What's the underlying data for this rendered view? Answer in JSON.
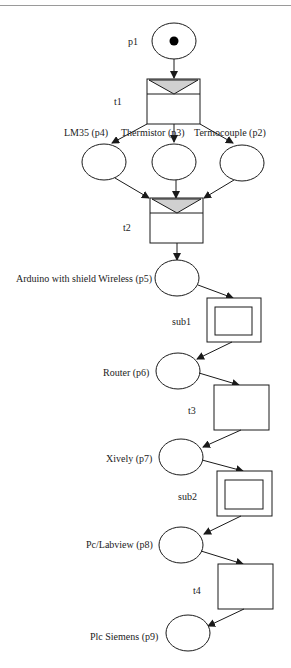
{
  "diagram": {
    "type": "petri-net",
    "colors": {
      "stroke": "#1a1a1a",
      "immediate_fill": "#d0d0d0",
      "background": "#ffffff",
      "rule": "#9a9a9a"
    },
    "places": [
      {
        "id": "p1",
        "label": "p1",
        "tokens": 1
      },
      {
        "id": "p4",
        "label": "LM35 (p4)",
        "tokens": 0
      },
      {
        "id": "p3",
        "label": "Thermistor (p3)",
        "tokens": 0
      },
      {
        "id": "p2",
        "label": "Termocouple (p2)",
        "tokens": 0
      },
      {
        "id": "p5",
        "label": "Arduino with shield Wireless (p5)",
        "tokens": 0
      },
      {
        "id": "p6",
        "label": "Router (p6)",
        "tokens": 0
      },
      {
        "id": "p7",
        "label": "Xively (p7)",
        "tokens": 0
      },
      {
        "id": "p8",
        "label": "Pc/Labview (p8)",
        "tokens": 0
      },
      {
        "id": "p9",
        "label": "Plc Siemens (p9)",
        "tokens": 0
      }
    ],
    "transitions": [
      {
        "id": "t1",
        "label": "t1",
        "kind": "immediate"
      },
      {
        "id": "t2",
        "label": "t2",
        "kind": "immediate"
      },
      {
        "id": "sub1",
        "label": "sub1",
        "kind": "subnet"
      },
      {
        "id": "t3",
        "label": "t3",
        "kind": "timed"
      },
      {
        "id": "sub2",
        "label": "sub2",
        "kind": "subnet"
      },
      {
        "id": "t4",
        "label": "t4",
        "kind": "timed"
      }
    ],
    "arcs": [
      [
        "p1",
        "t1"
      ],
      [
        "t1",
        "p4"
      ],
      [
        "t1",
        "p3"
      ],
      [
        "t1",
        "p2"
      ],
      [
        "p4",
        "t2"
      ],
      [
        "p3",
        "t2"
      ],
      [
        "p2",
        "t2"
      ],
      [
        "t2",
        "p5"
      ],
      [
        "p5",
        "sub1"
      ],
      [
        "sub1",
        "p6"
      ],
      [
        "p6",
        "t3"
      ],
      [
        "t3",
        "p7"
      ],
      [
        "p7",
        "sub2"
      ],
      [
        "sub2",
        "p8"
      ],
      [
        "p8",
        "t4"
      ],
      [
        "t4",
        "p9"
      ]
    ]
  }
}
